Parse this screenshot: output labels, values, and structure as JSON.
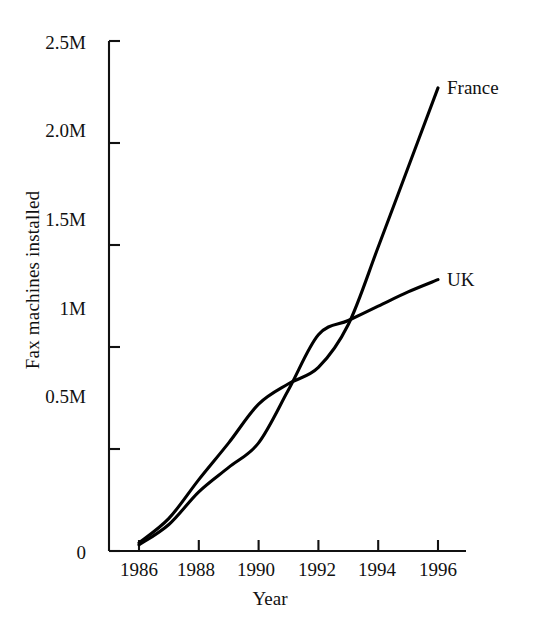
{
  "chart_data": {
    "type": "line",
    "title": "",
    "subtitle": "",
    "xlabel": "Year",
    "ylabel": "Fax machines installed",
    "x": [
      1986,
      1987,
      1988,
      1989,
      1990,
      1991,
      1992,
      1993,
      1994,
      1995,
      1996
    ],
    "xlim": [
      1985,
      1997
    ],
    "ylim": [
      0,
      2500000
    ],
    "grid": false,
    "legend_position": "line-end-labels",
    "xticks": [
      1986,
      1988,
      1990,
      1992,
      1994,
      1996
    ],
    "xticklabels": [
      "1986",
      "1988",
      "1990",
      "1992",
      "1994",
      "1996"
    ],
    "yticks": [
      0,
      500000,
      1000000,
      1500000,
      2000000,
      2500000
    ],
    "yticklabels": [
      "0",
      "0.5M",
      "1M",
      "1.5M",
      "2.0M",
      "2.5M"
    ],
    "series": [
      {
        "name": "France",
        "label": "France",
        "color": "#000000",
        "values": [
          40000,
          160000,
          350000,
          530000,
          720000,
          820000,
          900000,
          1110000,
          1490000,
          1880000,
          2270000
        ]
      },
      {
        "name": "UK",
        "label": "UK",
        "color": "#000000",
        "values": [
          30000,
          130000,
          290000,
          410000,
          530000,
          790000,
          1060000,
          1130000,
          1200000,
          1270000,
          1330000
        ]
      }
    ],
    "annotations": [
      {
        "text": "France",
        "x": 1996,
        "y": 2270000
      },
      {
        "text": "UK",
        "x": 1996,
        "y": 1330000
      }
    ]
  },
  "axis": {
    "y_label": "Fax machines installed",
    "x_label": "Year",
    "ytick_labels": [
      "2.5M",
      "2.0M",
      "1.5M",
      "1M",
      "0.5M",
      "0"
    ],
    "xtick_labels": [
      "1986",
      "1988",
      "1990",
      "1992",
      "1994",
      "1996"
    ]
  },
  "labels": {
    "france": "France",
    "uk": "UK"
  }
}
